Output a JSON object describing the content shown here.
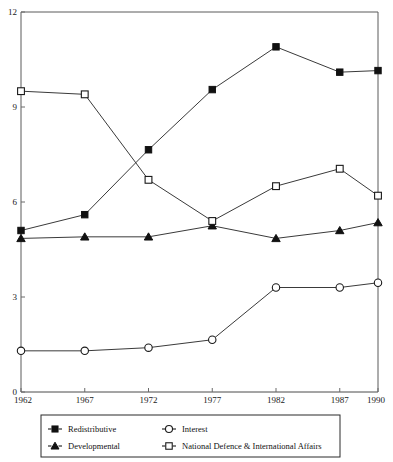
{
  "chart_data": {
    "type": "line",
    "title": "",
    "subtitle": "",
    "xlabel": "",
    "ylabel": "",
    "categories": [
      "1962",
      "1967",
      "1972",
      "1977",
      "1982",
      "1987",
      "1990"
    ],
    "x": [
      1962,
      1967,
      1972,
      1977,
      1982,
      1987,
      1990
    ],
    "xlim": [
      1962,
      1990
    ],
    "ylim": [
      0,
      12
    ],
    "yticks": [
      "0",
      "3",
      "6",
      "9",
      "12"
    ],
    "ytick_values": [
      0,
      3,
      6,
      9,
      12
    ],
    "xticks": [
      "1962",
      "1967",
      "1972",
      "1977",
      "1982",
      "1987",
      "1990"
    ],
    "grid": false,
    "legend_position": "below-axes",
    "series": [
      {
        "name": "Redistributive",
        "marker": "filled-square",
        "values": [
          5.1,
          5.6,
          7.65,
          9.55,
          10.9,
          10.1,
          10.15
        ]
      },
      {
        "name": "Developmental",
        "marker": "filled-triangle",
        "values": [
          4.85,
          4.9,
          4.9,
          5.25,
          4.85,
          5.1,
          5.35
        ]
      },
      {
        "name": "Interest",
        "marker": "open-circle",
        "values": [
          1.3,
          1.3,
          1.4,
          1.65,
          3.3,
          3.3,
          3.45
        ]
      },
      {
        "name": "National Defence & International Affairs",
        "marker": "open-square",
        "values": [
          9.5,
          9.4,
          6.7,
          5.4,
          6.5,
          7.05,
          6.2
        ]
      }
    ]
  },
  "legend": {
    "entries": [
      {
        "label": "Redistributive",
        "marker": "filled-square"
      },
      {
        "label": "Developmental",
        "marker": "filled-triangle"
      },
      {
        "label": "Interest",
        "marker": "open-circle"
      },
      {
        "label": "National Defence & International Affairs",
        "marker": "open-square"
      }
    ]
  },
  "colors": {
    "ink": "#111111",
    "axis": "#4a4a4a",
    "line": "#3a3a3a",
    "background": "#ffffff"
  }
}
